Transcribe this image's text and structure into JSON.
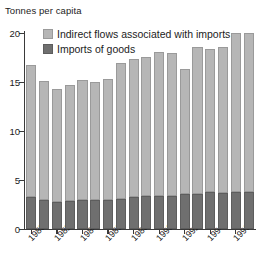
{
  "chart_data": {
    "type": "bar",
    "title": "",
    "ylabel": "Tonnes per capita",
    "xlabel": "",
    "stacked": true,
    "grid": false,
    "legend_position": "top-left",
    "ylim": [
      0,
      20
    ],
    "yticks": [
      0,
      5,
      10,
      15,
      20
    ],
    "ytick_labels": [
      "0",
      "5",
      "10",
      "15",
      "20"
    ],
    "x": [
      1980,
      1981,
      1982,
      1983,
      1984,
      1985,
      1986,
      1987,
      1988,
      1989,
      1990,
      1991,
      1992,
      1993,
      1994,
      1995,
      1996,
      1997
    ],
    "categories": [
      "1980",
      "1981",
      "1982",
      "1983",
      "1984",
      "1985",
      "1986",
      "1987",
      "1988",
      "1989",
      "1990",
      "1991",
      "1992",
      "1993",
      "1994",
      "1995",
      "1996",
      "1997"
    ],
    "xtick_labels": [
      "1980",
      "1982",
      "1984",
      "1986",
      "1988",
      "1990",
      "1992",
      "1994",
      "1996"
    ],
    "xtick_values": [
      1980,
      1982,
      1984,
      1986,
      1988,
      1990,
      1992,
      1994,
      1996
    ],
    "series": [
      {
        "name": "Imports of goods",
        "color": "#6f6f6f",
        "values": [
          3.3,
          3.0,
          2.8,
          2.9,
          3.0,
          3.0,
          3.0,
          3.1,
          3.3,
          3.4,
          3.4,
          3.4,
          3.6,
          3.6,
          3.8,
          3.7,
          3.8,
          3.8
        ]
      },
      {
        "name": "Indirect flows associated with imports",
        "color": "#b6b6b6",
        "values": [
          13.4,
          12.1,
          11.5,
          11.8,
          12.2,
          12.0,
          12.3,
          13.8,
          14.0,
          14.2,
          14.7,
          14.6,
          12.7,
          15.0,
          14.6,
          14.9,
          16.2,
          16.2
        ]
      }
    ],
    "totals": [
      16.7,
      15.1,
      14.3,
      14.7,
      15.2,
      15.0,
      15.3,
      16.9,
      17.3,
      17.6,
      18.1,
      18.0,
      16.3,
      18.6,
      18.4,
      18.6,
      20.0,
      20.0
    ]
  },
  "axis": {
    "y_title": "Tonnes per capita"
  },
  "legend": {
    "items": [
      {
        "label": "Indirect flows associated with imports",
        "color": "#b6b6b6"
      },
      {
        "label": "Imports of goods",
        "color": "#6f6f6f"
      }
    ]
  }
}
